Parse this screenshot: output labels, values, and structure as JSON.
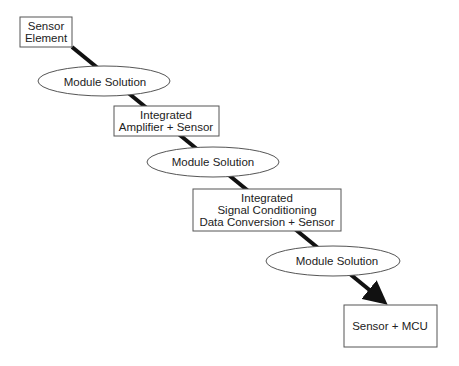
{
  "diagram": {
    "type": "flow",
    "nodes": [
      {
        "id": "sensor-element",
        "shape": "box",
        "lines": [
          "Sensor",
          "Element"
        ]
      },
      {
        "id": "module-1",
        "shape": "ellipse",
        "lines": [
          "Module Solution"
        ]
      },
      {
        "id": "integrated-amp",
        "shape": "box",
        "lines": [
          "Integrated",
          "Amplifier + Sensor"
        ]
      },
      {
        "id": "module-2",
        "shape": "ellipse",
        "lines": [
          "Module Solution"
        ]
      },
      {
        "id": "integrated-signal",
        "shape": "box",
        "lines": [
          "Integrated",
          "Signal Conditioning",
          "Data Conversion + Sensor"
        ]
      },
      {
        "id": "module-3",
        "shape": "ellipse",
        "lines": [
          "Module Solution"
        ]
      },
      {
        "id": "sensor-mcu",
        "shape": "box",
        "lines": [
          "Sensor + MCU"
        ]
      }
    ],
    "connector": {
      "from": "sensor-element",
      "to": "sensor-mcu",
      "style": "thick-arrow"
    }
  },
  "colors": {
    "stroke": "#555555",
    "connector": "#111111",
    "text": "#222222",
    "background": "#ffffff"
  }
}
